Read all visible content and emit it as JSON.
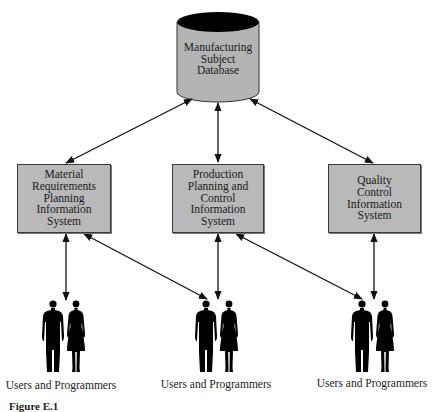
{
  "diagram": {
    "database": {
      "label": "Manufacturing\nSubject\nDatabase",
      "fill": "#b4b4b4",
      "top_fill": "#000000"
    },
    "systems": [
      {
        "id": "mrp",
        "label": "Material\nRequirements\nPlanning\nInformation\nSystem"
      },
      {
        "id": "ppc",
        "label": "Production\nPlanning and\nControl\nInformation\nSystem"
      },
      {
        "id": "qc",
        "label": "Quality\nControl\nInformation\nSystem"
      }
    ],
    "user_groups": [
      {
        "label": "Users and Programmers"
      },
      {
        "label": "Users and Programmers"
      },
      {
        "label": "Users and Programmers"
      }
    ],
    "connections": [
      {
        "from": "database",
        "to": "mrp",
        "type": "bidirectional"
      },
      {
        "from": "database",
        "to": "ppc",
        "type": "bidirectional"
      },
      {
        "from": "database",
        "to": "qc",
        "type": "bidirectional"
      },
      {
        "from": "mrp",
        "to": "users-1",
        "type": "bidirectional"
      },
      {
        "from": "mrp",
        "to": "users-2",
        "type": "bidirectional"
      },
      {
        "from": "ppc",
        "to": "users-2",
        "type": "bidirectional"
      },
      {
        "from": "ppc",
        "to": "users-3",
        "type": "bidirectional"
      },
      {
        "from": "qc",
        "to": "users-3",
        "type": "bidirectional"
      }
    ],
    "caption": "Figure E.1"
  },
  "colors": {
    "box_fill": "#b9b9b9",
    "line": "#111111",
    "text": "#1a1a1a"
  }
}
